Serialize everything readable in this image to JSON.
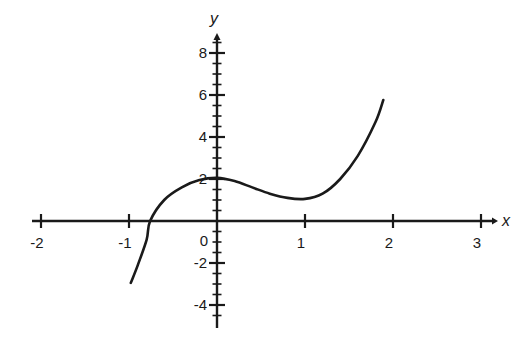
{
  "chart_data": {
    "type": "line",
    "title": "",
    "xlabel": "x",
    "ylabel": "y",
    "xlim": [
      -2.1,
      3.15
    ],
    "ylim": [
      -5,
      9
    ],
    "x_ticks": [
      -2,
      -1,
      1,
      2,
      3
    ],
    "x_tick_labels": [
      "-2",
      "-1",
      "1",
      "2",
      "3"
    ],
    "y_ticks": [
      -4,
      -2,
      2,
      4,
      6,
      8
    ],
    "y_tick_labels": [
      "-4",
      "-2",
      "2",
      "4",
      "6",
      "8"
    ],
    "origin_label": "0",
    "y_minor_tick_step": 0.5,
    "grid": false,
    "series": [
      {
        "name": "f(x)",
        "x": [
          -0.98,
          -0.9,
          -0.8,
          -0.76,
          -0.6,
          -0.4,
          -0.2,
          0.0,
          0.2,
          0.4,
          0.6,
          0.8,
          1.0,
          1.2,
          1.4,
          1.6,
          1.8,
          1.89
        ],
        "y": [
          -2.95,
          -2.1,
          -0.9,
          0.0,
          1.0,
          1.6,
          1.95,
          2.05,
          1.9,
          1.6,
          1.3,
          1.1,
          1.05,
          1.3,
          2.0,
          3.1,
          4.7,
          5.76
        ]
      }
    ]
  }
}
